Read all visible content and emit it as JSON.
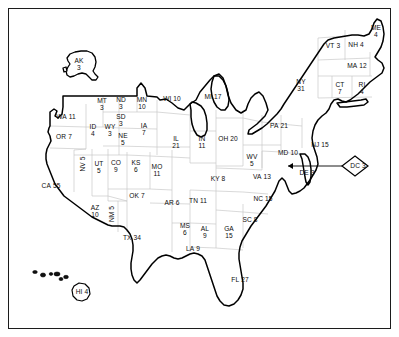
{
  "map": {
    "title": "United States Electoral College Map",
    "frame_color": "#1c1c1c",
    "background_color": "#ffffff",
    "national_outline_color": "#000000",
    "state_outline_color": "#c9c9c9",
    "label_color": "#0d0d0d",
    "total_electoral_votes": 538,
    "states": [
      {
        "abbr": "AK",
        "votes": "3",
        "x": 79,
        "y": 64,
        "layout": "two-line",
        "inset": true
      },
      {
        "abbr": "WA",
        "votes": "11",
        "x": 66,
        "y": 117,
        "layout": "one-line"
      },
      {
        "abbr": "OR",
        "votes": "7",
        "x": 64,
        "y": 137,
        "layout": "one-line"
      },
      {
        "abbr": "MT",
        "votes": "3",
        "x": 102,
        "y": 104,
        "layout": "two-line"
      },
      {
        "abbr": "ND",
        "votes": "3",
        "x": 121,
        "y": 103,
        "layout": "two-line"
      },
      {
        "abbr": "MN",
        "votes": "10",
        "x": 142,
        "y": 103,
        "layout": "two-line"
      },
      {
        "abbr": "WI",
        "votes": "10",
        "x": 172,
        "y": 99,
        "layout": "one-line"
      },
      {
        "abbr": "SD",
        "votes": "3",
        "x": 121,
        "y": 120,
        "layout": "two-line"
      },
      {
        "abbr": "ID",
        "votes": "4",
        "x": 93,
        "y": 130,
        "layout": "two-line"
      },
      {
        "abbr": "WY",
        "votes": "3",
        "x": 110,
        "y": 130,
        "layout": "two-line"
      },
      {
        "abbr": "NE",
        "votes": "5",
        "x": 123,
        "y": 139,
        "layout": "two-line"
      },
      {
        "abbr": "IA",
        "votes": "7",
        "x": 144,
        "y": 129,
        "layout": "two-line"
      },
      {
        "abbr": "IL",
        "votes": "21",
        "x": 176,
        "y": 142,
        "layout": "two-line"
      },
      {
        "abbr": "MI",
        "votes": "17",
        "x": 213,
        "y": 97,
        "layout": "one-line"
      },
      {
        "abbr": "IN",
        "votes": "11",
        "x": 202,
        "y": 142,
        "layout": "two-line"
      },
      {
        "abbr": "OH",
        "votes": "20",
        "x": 228,
        "y": 139,
        "layout": "one-line"
      },
      {
        "abbr": "PA",
        "votes": "21",
        "x": 279,
        "y": 126,
        "layout": "one-line"
      },
      {
        "abbr": "NY",
        "votes": "31",
        "x": 301,
        "y": 85,
        "layout": "two-line"
      },
      {
        "abbr": "VT",
        "votes": "3",
        "x": 333,
        "y": 46,
        "layout": "one-line"
      },
      {
        "abbr": "NH",
        "votes": "4",
        "x": 356,
        "y": 45,
        "layout": "one-line"
      },
      {
        "abbr": "ME",
        "votes": "4",
        "x": 376,
        "y": 31,
        "layout": "two-line"
      },
      {
        "abbr": "MA",
        "votes": "12",
        "x": 357,
        "y": 66,
        "layout": "one-line"
      },
      {
        "abbr": "CT",
        "votes": "7",
        "x": 340,
        "y": 88,
        "layout": "two-line"
      },
      {
        "abbr": "RI",
        "votes": "4",
        "x": 362,
        "y": 88,
        "layout": "two-line"
      },
      {
        "abbr": "NJ",
        "votes": "15",
        "x": 320,
        "y": 145,
        "layout": "one-line"
      },
      {
        "abbr": "MD",
        "votes": "10",
        "x": 288,
        "y": 153,
        "layout": "one-line"
      },
      {
        "abbr": "DE",
        "votes": "3",
        "x": 307,
        "y": 173,
        "layout": "one-line"
      },
      {
        "abbr": "DC",
        "votes": "3",
        "x": 358,
        "y": 166,
        "layout": "diamond",
        "callout": true
      },
      {
        "abbr": "WV",
        "votes": "5",
        "x": 252,
        "y": 160,
        "layout": "two-line"
      },
      {
        "abbr": "VA",
        "votes": "13",
        "x": 262,
        "y": 177,
        "layout": "one-line"
      },
      {
        "abbr": "KY",
        "votes": "8",
        "x": 218,
        "y": 179,
        "layout": "one-line"
      },
      {
        "abbr": "NC",
        "votes": "15",
        "x": 263,
        "y": 199,
        "layout": "one-line"
      },
      {
        "abbr": "TN",
        "votes": "11",
        "x": 198,
        "y": 201,
        "layout": "one-line"
      },
      {
        "abbr": "SC",
        "votes": "8",
        "x": 250,
        "y": 220,
        "layout": "one-line"
      },
      {
        "abbr": "GA",
        "votes": "15",
        "x": 229,
        "y": 232,
        "layout": "two-line"
      },
      {
        "abbr": "AL",
        "votes": "9",
        "x": 205,
        "y": 232,
        "layout": "two-line"
      },
      {
        "abbr": "MS",
        "votes": "6",
        "x": 185,
        "y": 229,
        "layout": "two-line"
      },
      {
        "abbr": "AR",
        "votes": "6",
        "x": 172,
        "y": 203,
        "layout": "one-line"
      },
      {
        "abbr": "LA",
        "votes": "9",
        "x": 193,
        "y": 249,
        "layout": "one-line"
      },
      {
        "abbr": "MO",
        "votes": "11",
        "x": 157,
        "y": 170,
        "layout": "two-line"
      },
      {
        "abbr": "KS",
        "votes": "6",
        "x": 136,
        "y": 166,
        "layout": "two-line"
      },
      {
        "abbr": "OK",
        "votes": "7",
        "x": 137,
        "y": 196,
        "layout": "one-line"
      },
      {
        "abbr": "TX",
        "votes": "34",
        "x": 132,
        "y": 238,
        "layout": "one-line"
      },
      {
        "abbr": "CO",
        "votes": "9",
        "x": 116,
        "y": 166,
        "layout": "two-line"
      },
      {
        "abbr": "UT",
        "votes": "5",
        "x": 99,
        "y": 167,
        "layout": "two-line"
      },
      {
        "abbr": "NV",
        "votes": "5",
        "x": 83,
        "y": 164,
        "layout": "rot"
      },
      {
        "abbr": "CA",
        "votes": "55",
        "x": 51,
        "y": 186,
        "layout": "one-line"
      },
      {
        "abbr": "AZ",
        "votes": "10",
        "x": 95,
        "y": 211,
        "layout": "two-line"
      },
      {
        "abbr": "NM",
        "votes": "5",
        "x": 112,
        "y": 214,
        "layout": "rot"
      },
      {
        "abbr": "FL",
        "votes": "27",
        "x": 240,
        "y": 280,
        "layout": "one-line"
      },
      {
        "abbr": "HI",
        "votes": "4",
        "x": 82,
        "y": 292,
        "layout": "inset-hi",
        "inset": true
      }
    ]
  }
}
